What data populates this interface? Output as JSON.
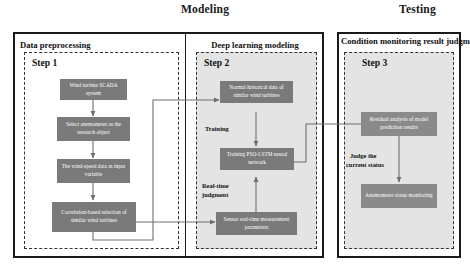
{
  "phases": [
    {
      "id": "modeling",
      "label": "Modeling"
    },
    {
      "id": "testing",
      "label": "Testing"
    }
  ],
  "panels": [
    {
      "id": "data-preprocessing",
      "label": "Data preprocessing"
    },
    {
      "id": "deep-learning-modeling",
      "label": "Deep learning modeling"
    },
    {
      "id": "condition-monitoring",
      "label": "Condition monitoring result judgment"
    }
  ],
  "steps": [
    {
      "id": "step-1",
      "label": "Step 1"
    },
    {
      "id": "step-2",
      "label": "Step 2"
    },
    {
      "id": "step-3",
      "label": "Step 3"
    }
  ],
  "nodes": [
    {
      "id": "wind-turbine-scada-system",
      "label": "Wind turbine SCADA system"
    },
    {
      "id": "select-anemometer",
      "label": "Select anemometer as the research object"
    },
    {
      "id": "wind-speed-input-variable",
      "label": "The wind-speed data as input variable"
    },
    {
      "id": "correlation-based-selection",
      "label": "Correlation-based selection of similar wind turbines"
    },
    {
      "id": "normal-historical-data",
      "label": "Normal historical data of similar wind turbines"
    },
    {
      "id": "training-pso-lstm",
      "label": "Training PSO-LSTM neural network"
    },
    {
      "id": "sensor-real-time-parameters",
      "label": "Sensor real-time measurement parameters"
    },
    {
      "id": "residual-analysis",
      "label": "Residual analysis of model prediction results"
    },
    {
      "id": "anemometer-status-monitoring",
      "label": "Anemometer status monitoring"
    }
  ],
  "edge_labels": [
    {
      "id": "training",
      "label": "Training"
    },
    {
      "id": "real-time-judgment-line1",
      "label": "Real-time"
    },
    {
      "id": "real-time-judgment-line2",
      "label": "judgment"
    },
    {
      "id": "judge-status-line1",
      "label": "Judge the"
    },
    {
      "id": "judge-status-line2",
      "label": "current status"
    }
  ],
  "colors": {
    "node_fill": "#7a7a7a",
    "node_fill_alt": "#8a8a8a",
    "panel_border": "#1a1a1a",
    "step_border": "#333333",
    "step_shaded_fill": "#e4e4e4",
    "wire": "#6e6e6e",
    "text_dark": "#111111",
    "node_text": "#ffffff",
    "background": "#ffffff"
  }
}
